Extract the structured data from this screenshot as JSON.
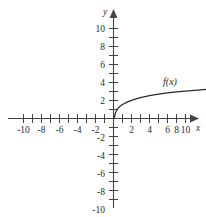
{
  "chart_data": {
    "type": "line",
    "title": "",
    "xlabel": "x",
    "ylabel": "y",
    "xlim": [
      -11.5,
      11.5
    ],
    "ylim": [
      -11.5,
      11.5
    ],
    "grid": false,
    "legend": "none",
    "x_tick_labels": [
      "-10",
      "-8",
      "-6",
      "-4",
      "-2",
      "2",
      "4",
      "6",
      "8",
      "10"
    ],
    "x_tick_values": [
      -10,
      -8,
      -6,
      -4,
      -2,
      2,
      4,
      6,
      8,
      10
    ],
    "y_tick_labels": [
      "10",
      "8",
      "6",
      "4",
      "2",
      "-2",
      "-4",
      "-6",
      "-8",
      "-10"
    ],
    "y_tick_values": [
      10,
      8,
      6,
      4,
      2,
      -2,
      -4,
      -6,
      -8,
      -10
    ],
    "minor_tick_interval": 1,
    "series": [
      {
        "name": "f(x)",
        "label": "f(x)",
        "color": "#2b2b2b",
        "x": [
          0.05,
          0.1,
          0.2,
          0.3,
          0.5,
          0.75,
          1,
          1.5,
          2,
          2.5,
          3,
          3.5,
          4,
          5,
          6,
          7,
          8,
          9,
          10,
          11
        ],
        "y": [
          0.02,
          0.19,
          0.55,
          0.8,
          1.12,
          1.38,
          1.55,
          1.82,
          2.02,
          2.18,
          2.31,
          2.43,
          2.53,
          2.7,
          2.84,
          2.95,
          3.05,
          3.13,
          3.21,
          3.28
        ]
      }
    ]
  },
  "labels": {
    "x_axis_name": "x",
    "y_axis_name": "y",
    "curve_label": "f(x)"
  },
  "colors": {
    "axis": "#444444",
    "curve": "#2b2b2b",
    "text": "#2b2b2b",
    "background": "#ffffff"
  }
}
